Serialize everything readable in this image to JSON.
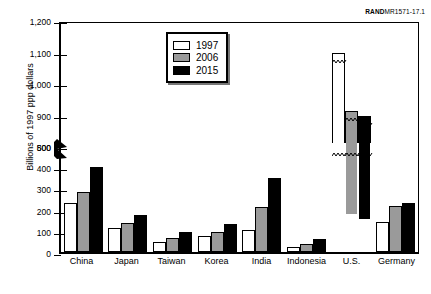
{
  "credit": {
    "bold": "RAND",
    "rest": "MR1571-17.1"
  },
  "chart_data": {
    "type": "bar",
    "title": "",
    "xlabel": "",
    "ylabel": "Billions of 1997 ppp dollars",
    "categories": [
      "China",
      "Japan",
      "Taiwan",
      "Korea",
      "India",
      "Indonesia",
      "U.S.",
      "Germany"
    ],
    "series": [
      {
        "name": "1997",
        "color": "#ffffff",
        "values": [
          230,
          115,
          45,
          75,
          105,
          25,
          1105,
          140
        ]
      },
      {
        "name": "2006",
        "color": "#9a9a9a",
        "values": [
          285,
          135,
          65,
          95,
          210,
          40,
          920,
          215
        ]
      },
      {
        "name": "2015",
        "color": "#000000",
        "values": [
          400,
          175,
          95,
          130,
          350,
          60,
          905,
          230
        ]
      }
    ],
    "ylim": [
      0,
      1200
    ],
    "yticks": [
      0,
      100,
      200,
      300,
      400,
      500,
      800,
      900,
      1000,
      1100,
      1200
    ],
    "ytick_labels": [
      "0",
      "100",
      "200",
      "300",
      "400",
      "500",
      "800",
      "900",
      "1,000",
      "1,100",
      "1,200"
    ],
    "axis_break": {
      "below": 500,
      "above": 800
    },
    "grid": false,
    "legend_position": "upper-center",
    "legend_entries": [
      "1997",
      "2006",
      "2015"
    ]
  }
}
